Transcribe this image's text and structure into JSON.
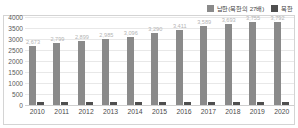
{
  "chart_data": {
    "type": "bar",
    "title": "",
    "subtitle": "",
    "xlabel": "",
    "ylabel": "",
    "ylim": [
      0,
      4000
    ],
    "ytick_step": 500,
    "yticks": [
      "4000",
      "3500",
      "3000",
      "2500",
      "2000",
      "1500",
      "1000",
      "500",
      "0"
    ],
    "grid": true,
    "legend_position": "top-right",
    "categories": [
      "2010",
      "2011",
      "2012",
      "2013",
      "2014",
      "2015",
      "2016",
      "2017",
      "2018",
      "2019",
      "2020"
    ],
    "series": [
      {
        "name": "남한(북한의 27배)",
        "color": "#8a8a8a",
        "values": [
          2673,
          2799,
          2899,
          2985,
          3096,
          3290,
          3411,
          3589,
          3693,
          3755,
          3792
        ],
        "labels": [
          "2,673",
          "2,799",
          "2,899",
          "2,985",
          "3,096",
          "3,290",
          "3,411",
          "3,589",
          "3,693",
          "3,755",
          "3,792"
        ]
      },
      {
        "name": "북한",
        "color": "#4f4f4f",
        "values": [
          124,
          130,
          137,
          138,
          139,
          139,
          146,
          146,
          143,
          141,
          138
        ],
        "labels": [
          "124",
          "130",
          "137",
          "138",
          "139",
          "139",
          "146",
          "146",
          "143",
          "141",
          "138"
        ]
      }
    ]
  },
  "legend": {
    "entries": [
      {
        "label": "남한(북한의 27배)",
        "color": "#8a8a8a"
      },
      {
        "label": "북한",
        "color": "#4f4f4f"
      }
    ]
  },
  "colors": {
    "south_bar": "#8a8a8a",
    "north_bar": "#4f4f4f",
    "gridline": "#e8e8e8",
    "frame_border": "#d4d4d4",
    "axis_text": "#5a5a5a",
    "value_label": "#b4b4b4",
    "background": "#ffffff"
  }
}
